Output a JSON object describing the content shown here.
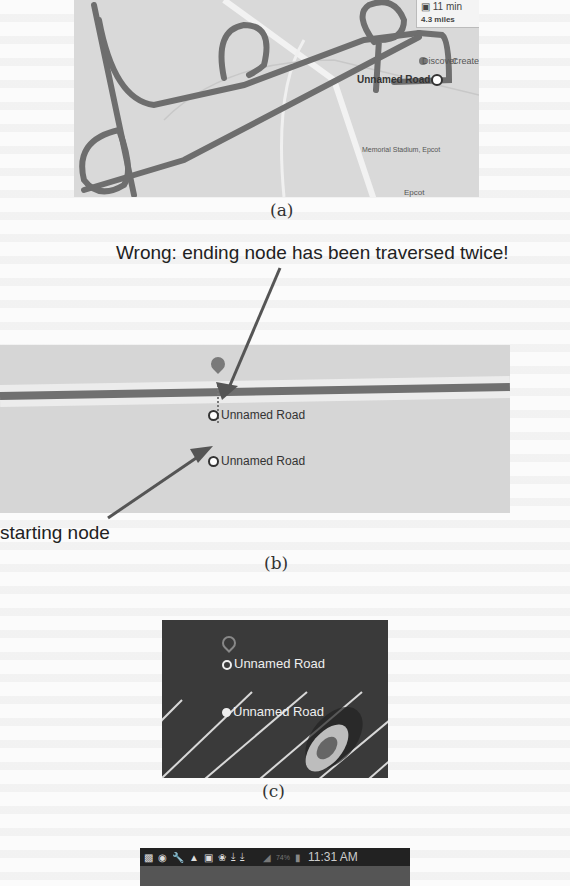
{
  "figure_a": {
    "caption": "(a)",
    "route_callout": {
      "time": "11 min",
      "distance": "4.3 miles",
      "icon": "car-icon"
    },
    "labels": {
      "discover": "Discover",
      "create": "Create",
      "unnamed_road": "Unnamed Road",
      "memorial_station": "Memorial Stadium, Epcot",
      "road_label": "World Dr",
      "epcot": "Epcot"
    }
  },
  "annotations": {
    "wrong_label": "Wrong: ending node has been traversed twice!",
    "starting_label": "starting node"
  },
  "figure_b": {
    "caption": "(b)",
    "ending_node_label": "Unnamed Road",
    "starting_node_label": "Unnamed Road"
  },
  "figure_c": {
    "caption": "(c)",
    "node1_label": "Unnamed Road",
    "node2_label": "Unnamed Road"
  },
  "figure_d": {
    "status_bar": {
      "icons": [
        "sim-icon",
        "location-icon",
        "wrench-icon",
        "warning-icon",
        "image-icon",
        "accessibility-icon",
        "download-icon",
        "download-icon"
      ],
      "signal": "signal-icon",
      "battery_percent": "74%",
      "time": "11:31 AM"
    }
  },
  "colors": {
    "route": "#6e6e6e",
    "map_bg": "#d9d9d9",
    "dark_map_bg": "#3a3a3a",
    "arrow": "#555555"
  }
}
